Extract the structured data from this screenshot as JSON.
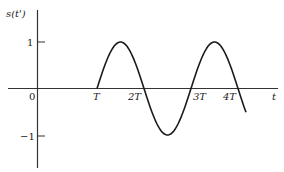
{
  "chart_data": {
    "type": "line",
    "title": "",
    "ylabel": "s(t')",
    "xlabel": "t",
    "ylim": [
      -1,
      1
    ],
    "yticks": [
      {
        "value": 1,
        "label": "1"
      },
      {
        "value": -1,
        "label": "-1"
      }
    ],
    "xticks": [
      {
        "value": 0,
        "label": "0"
      },
      {
        "value": 1,
        "label": "T"
      },
      {
        "value": 2,
        "label": "2T"
      },
      {
        "value": 3,
        "label": "3T"
      },
      {
        "value": 4,
        "label": "4T"
      }
    ],
    "series": [
      {
        "name": "s(t')",
        "description": "sinusoid starting at t=T, rising to 1, period ~2T",
        "x": [
          1.0,
          1.5,
          2.0,
          2.5,
          3.0,
          3.5,
          4.0,
          4.2
        ],
        "values": [
          0,
          1,
          0,
          -1,
          0,
          1,
          0,
          -0.55
        ]
      }
    ],
    "grid": false,
    "legend": null
  },
  "labels": {
    "y_axis": "s(t')",
    "x_axis": "t",
    "origin": "0",
    "y_pos": "1",
    "y_neg": "−1",
    "t1": "T",
    "t2": "2T",
    "t3": "3T",
    "t4": "4T"
  },
  "colors": {
    "line": "#1a1a1a",
    "axis": "#333333",
    "text": "#222222"
  }
}
